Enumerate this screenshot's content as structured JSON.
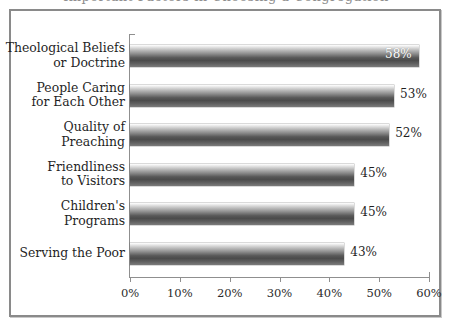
{
  "figure": {
    "clipped_title": "Important Factors in Choosing a Congregation"
  },
  "chart_data": {
    "type": "bar",
    "orientation": "horizontal",
    "title": "",
    "xlabel": "",
    "ylabel": "",
    "grid": false,
    "legend": null,
    "xlim": [
      0,
      60
    ],
    "xticks": [
      0,
      10,
      20,
      30,
      40,
      50,
      60
    ],
    "xtick_labels": [
      "0%",
      "10%",
      "20%",
      "30%",
      "40%",
      "50%",
      "60%"
    ],
    "categories": [
      "Theological Beliefs or Doctrine",
      "People Caring for Each Other",
      "Quality of Preaching",
      "Friendliness to Visitors",
      "Children's Programs",
      "Serving the Poor"
    ],
    "values": [
      58,
      53,
      52,
      45,
      45,
      43
    ],
    "value_labels": [
      "58%",
      "53%",
      "52%",
      "45%",
      "45%",
      "43%"
    ],
    "bar_color": "#4b4b4b",
    "bar_gradient": [
      "#ffffff",
      "#4b4b4b",
      "#7b7b7b"
    ],
    "axis_color": "#8f8f8f",
    "text_color": "#1f1f1f",
    "border_color": "#8a8a8a"
  },
  "bars": [
    {
      "line1": "Theological Beliefs",
      "line2": "or Doctrine",
      "value": 58,
      "value_label": "58%",
      "label_placement": "inside"
    },
    {
      "line1": "People Caring",
      "line2": "for Each Other",
      "value": 53,
      "value_label": "53%",
      "label_placement": "outside"
    },
    {
      "line1": "Quality of",
      "line2": "Preaching",
      "value": 52,
      "value_label": "52%",
      "label_placement": "outside"
    },
    {
      "line1": "Friendliness",
      "line2": "to Visitors",
      "value": 45,
      "value_label": "45%",
      "label_placement": "outside"
    },
    {
      "line1": "Children's",
      "line2": "Programs",
      "value": 45,
      "value_label": "45%",
      "label_placement": "outside"
    },
    {
      "line1": "Serving the Poor",
      "line2": "",
      "value": 43,
      "value_label": "43%",
      "label_placement": "outside"
    }
  ],
  "axis": {
    "ticks": [
      {
        "value": 0,
        "label": "0%"
      },
      {
        "value": 10,
        "label": "10%"
      },
      {
        "value": 20,
        "label": "20%"
      },
      {
        "value": 30,
        "label": "30%"
      },
      {
        "value": 40,
        "label": "40%"
      },
      {
        "value": 50,
        "label": "50%"
      },
      {
        "value": 60,
        "label": "60%"
      }
    ]
  }
}
